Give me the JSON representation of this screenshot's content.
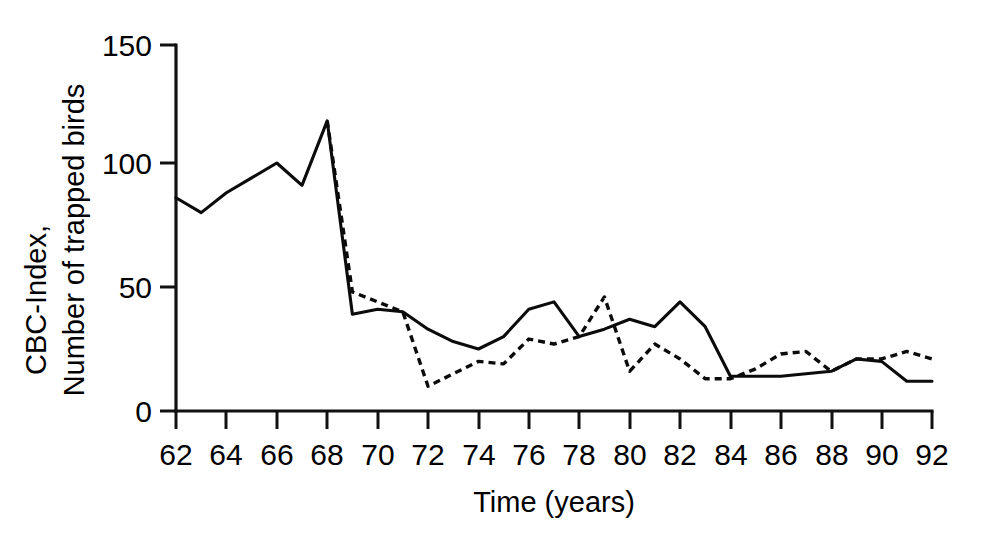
{
  "chart_data": {
    "type": "line",
    "title": "",
    "xlabel": "Time (years)",
    "ylabel": "CBC-Index,\nNumber of trapped birds",
    "ylabel_lines": [
      "CBC-Index,",
      "Number of trapped birds"
    ],
    "xlim": [
      62,
      92
    ],
    "ylim": [
      0,
      150
    ],
    "xticks": [
      62,
      64,
      66,
      68,
      70,
      72,
      74,
      76,
      78,
      80,
      82,
      84,
      86,
      88,
      90,
      92
    ],
    "xtick_labels": [
      "62",
      "64",
      "66",
      "68",
      "70",
      "72",
      "74",
      "76",
      "78",
      "80",
      "82",
      "84",
      "86",
      "88",
      "90",
      "92"
    ],
    "yticks": [
      0,
      50,
      100,
      150
    ],
    "ytick_labels": [
      "0",
      "50",
      "100",
      "150"
    ],
    "grid": false,
    "legend": "none",
    "x": [
      62,
      63,
      64,
      65,
      66,
      67,
      68,
      69,
      70,
      71,
      72,
      73,
      74,
      75,
      76,
      77,
      78,
      79,
      80,
      81,
      82,
      83,
      84,
      85,
      86,
      87,
      88,
      89,
      90,
      91,
      92
    ],
    "series": [
      {
        "name": "CBC-Index",
        "style": "solid",
        "color": "#0b0b0b",
        "x": [
          62,
          63,
          64,
          65,
          66,
          67,
          68,
          69,
          70,
          71,
          72,
          73,
          74,
          75,
          76,
          77,
          78,
          79,
          80,
          81,
          82,
          83,
          84,
          85,
          86,
          87,
          88,
          89,
          90,
          91,
          92
        ],
        "values": [
          86,
          80,
          88,
          94,
          100,
          91,
          117,
          39,
          41,
          40,
          33,
          28,
          25,
          30,
          41,
          44,
          30,
          33,
          37,
          34,
          44,
          34,
          14,
          14,
          14,
          15,
          16,
          21,
          20,
          12,
          12
        ]
      },
      {
        "name": "Number of trapped birds",
        "style": "dashed",
        "color": "#0b0b0b",
        "x": [
          68,
          69,
          70,
          71,
          72,
          73,
          74,
          75,
          76,
          77,
          78,
          79,
          80,
          81,
          82,
          83,
          84,
          85,
          86,
          87,
          88,
          89,
          90,
          91,
          92
        ],
        "values": [
          117,
          48,
          44,
          40,
          10,
          15,
          20,
          19,
          29,
          27,
          30,
          46,
          16,
          27,
          21,
          13,
          13,
          17,
          23,
          24,
          16,
          21,
          21,
          24,
          21
        ]
      }
    ],
    "annotations": [
      "Sharp crash between 1968 and 1969 in both series",
      "Both series overlap along the 1968-1969 descent"
    ]
  }
}
